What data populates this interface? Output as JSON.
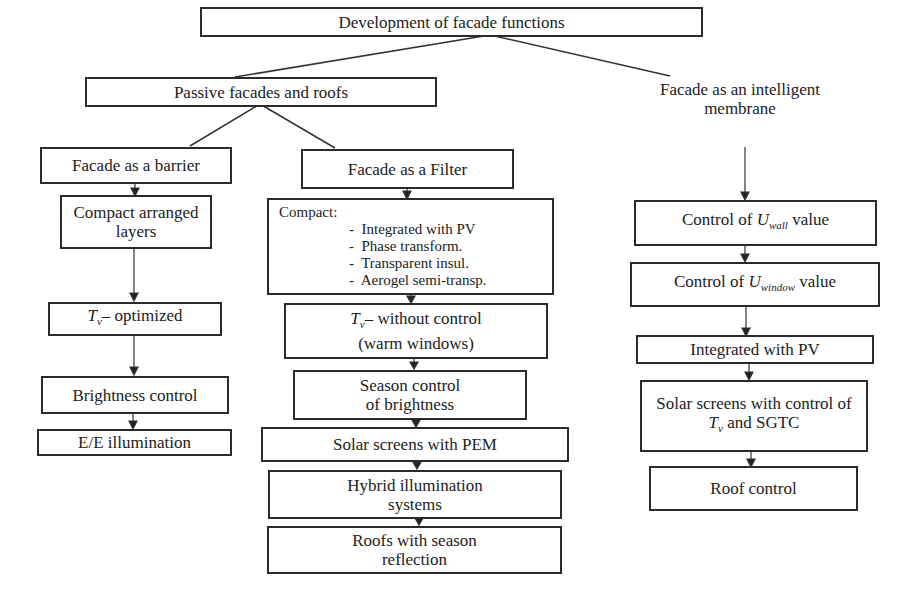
{
  "diagram": {
    "root": "Development of facade functions",
    "branches": [
      {
        "label": "Passive facades and roofs",
        "children": [
          {
            "label": "Facade as a barrier",
            "chain": [
              "Compact arranged layers",
              "Tv– optimized",
              "Brightness control",
              "E/E illumination"
            ]
          },
          {
            "label": "Facade as a Filter",
            "compact": {
              "title": "Compact:",
              "items": [
                "Integrated with PV",
                "Phase transform.",
                "Transparent insul.",
                "Aerogel semi-transp."
              ]
            },
            "chain": [
              "Tv– without control (warm windows)",
              "Season control of brightness",
              "Solar screens with PEM",
              "Hybrid illumination systems",
              "Roofs with season reflection"
            ]
          }
        ]
      },
      {
        "label": "Facade as an intelligent membrane",
        "chain": [
          "Control of Uwall value",
          "Control of Uwindow value",
          "Integrated with PV",
          "Solar screens with control of Tv and SGTC",
          "Roof control"
        ]
      }
    ]
  },
  "text": {
    "root": "Development of facade functions",
    "passive": "Passive facades and roofs",
    "barrier": "Facade as a barrier",
    "filter": "Facade as a Filter",
    "membrane_l1": "Facade as an intelligent",
    "membrane_l2": "membrane",
    "compact_layers_l1": "Compact arranged",
    "compact_layers_l2": "layers",
    "tv_symbol": "T",
    "tv_sub": "v",
    "tv_optimized": "– optimized",
    "brightness": "Brightness control",
    "ee": "E/E illumination",
    "compact_title": "Compact:",
    "compact_items": [
      "Integrated with PV",
      "Phase transform.",
      "Transparent insul.",
      "Aerogel semi-transp."
    ],
    "tv_without": "– without control",
    "warm_windows": "(warm windows)",
    "season_l1": "Season control",
    "season_l2": "of brightness",
    "pem": "Solar screens with PEM",
    "hybrid_l1": "Hybrid illumination",
    "hybrid_l2": "systems",
    "roofs_l1": "Roofs with season",
    "roofs_l2": "reflection",
    "uwall_pre": "Control of ",
    "u": "U",
    "wall_sub": "wall",
    "value": " value",
    "window_sub": "window",
    "pv": "Integrated with PV",
    "solar_l1": "Solar screens with control of",
    "solar_l2": " and SGTC",
    "roof_control": "Roof control"
  }
}
